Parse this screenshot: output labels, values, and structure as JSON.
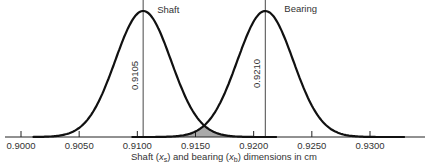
{
  "chart_data": {
    "type": "area",
    "title": "",
    "xlabel": "Shaft (x_s) and bearing (x_b) dimensions in cm",
    "xlabel_parts": {
      "pre": "Shaft (",
      "var1": "x",
      "sub1": "s",
      "mid": ") and bearing (",
      "var2": "x",
      "sub2": "b",
      "post": ") dimensions in cm"
    },
    "ylabel": "",
    "xlim": [
      0.8975,
      0.934
    ],
    "x_ticks": [
      "0.9000",
      "0.9050",
      "0.9100",
      "0.9150",
      "0.9200",
      "0.9250",
      "0.9300"
    ],
    "x_tick_values": [
      0.9,
      0.905,
      0.91,
      0.915,
      0.92,
      0.925,
      0.93
    ],
    "grid": false,
    "series": [
      {
        "name": "Shaft",
        "distribution": "normal",
        "mean": 0.9105,
        "mean_label": "0.9105",
        "sd": 0.0024
      },
      {
        "name": "Bearing",
        "distribution": "normal",
        "mean": 0.921,
        "mean_label": "0.9210",
        "sd": 0.0024
      }
    ],
    "shaded_region": {
      "description": "overlap of shaft and bearing distributions (interference)",
      "from": 0.9105,
      "to": 0.921,
      "color": "#a9a9a9"
    },
    "annotations": [
      "Shaft",
      "Bearing",
      "0.9105",
      "0.9210"
    ]
  },
  "fragment_text": "... Tendencies: Variation"
}
